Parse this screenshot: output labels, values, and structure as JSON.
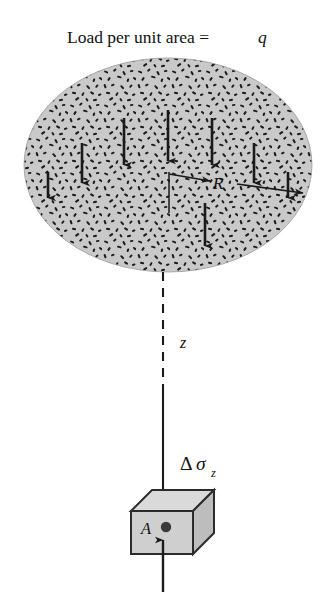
{
  "figure": {
    "name": "uniformly-loaded-circular-area-stress-diagram",
    "title_plain": "Load per unit area =",
    "title_symbol": "q",
    "labels": {
      "radius": "R",
      "depth": "z",
      "stress_increase_delta": "Δ",
      "stress_increase_sigma": "σ",
      "stress_increase_subscript": "z",
      "stress_increase_full": "Δσz",
      "element_area": "A"
    },
    "colors": {
      "background": "#ffffff",
      "loaded_area_fill": "#c9c9c9",
      "stipple": "#1a1a1a",
      "line": "#1a1a1a",
      "cube_front_fill": "#cfcfcf",
      "cube_top_fill": "#dadada",
      "cube_side_fill": "#bdbdbd",
      "cube_edge": "#2b2b2b",
      "point_dot": "#3a3a3a",
      "text": "#121212"
    },
    "geometry": {
      "loaded_area_shape": "ellipse",
      "loaded_area_center_x": 168,
      "loaded_area_center_y": 165,
      "loaded_area_radius_x": 144,
      "loaded_area_radius_y": 107,
      "radius_arrow_from_x": 168,
      "radius_arrow_to_x": 305,
      "radius_arrow_y": 182,
      "depth_line_x": 163,
      "depth_line_top_y": 272,
      "depth_dash_end_y": 386,
      "stress_arrow_tip_y": 512,
      "element_cube_left": 131,
      "element_cube_top": 511,
      "element_cube_width": 62,
      "element_cube_height": 43,
      "bottom_arrow_bottom_y": 592
    },
    "load_arrows": [
      {
        "name": "load-arrow-1",
        "x": 48,
        "y_top": 172,
        "y_bottom": 205
      },
      {
        "name": "load-arrow-2",
        "x": 82,
        "y_top": 143,
        "y_bottom": 190
      },
      {
        "name": "load-arrow-3",
        "x": 124,
        "y_top": 118,
        "y_bottom": 172
      },
      {
        "name": "load-arrow-4",
        "x": 168,
        "y_top": 110,
        "y_bottom": 168
      },
      {
        "name": "load-arrow-5",
        "x": 212,
        "y_top": 118,
        "y_bottom": 172
      },
      {
        "name": "load-arrow-6",
        "x": 254,
        "y_top": 143,
        "y_bottom": 190
      },
      {
        "name": "load-arrow-7",
        "x": 288,
        "y_top": 172,
        "y_bottom": 205
      },
      {
        "name": "load-arrow-center-lower",
        "x": 205,
        "y_top": 203,
        "y_bottom": 253
      }
    ]
  }
}
